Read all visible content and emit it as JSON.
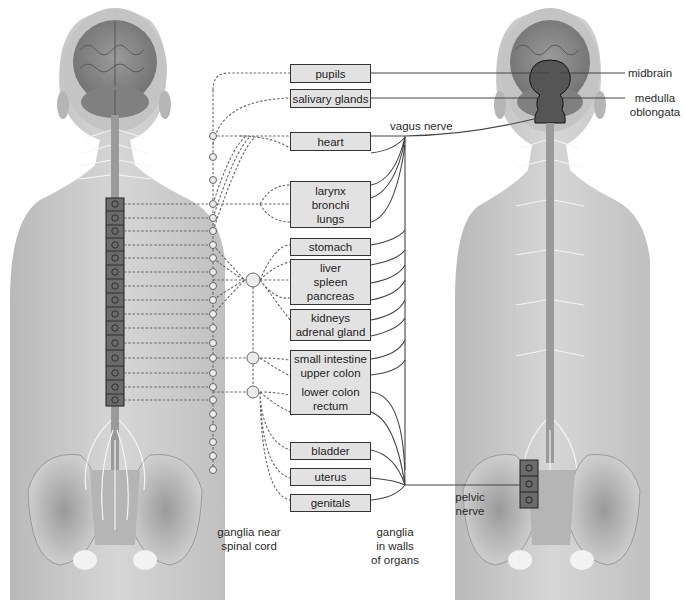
{
  "diagram": {
    "type": "autonomic-nervous-system",
    "left_figure": "sympathetic-division",
    "right_figure": "parasympathetic-division",
    "colors": {
      "skin": "#cfcfcf",
      "skin_dark": "#a8a8a8",
      "brain": "#8a8a8a",
      "nerve": "#f2f2f2",
      "box_fill": "#e2e2e2",
      "box_border": "#333333",
      "ganglion_fill": "#e6e6e6",
      "line": "#444444",
      "dashed_line": "#666666",
      "brainstem_fill": "#555555"
    }
  },
  "organs": [
    {
      "id": "pupils",
      "lines": [
        "pupils"
      ]
    },
    {
      "id": "salivary",
      "lines": [
        "salivary glands"
      ]
    },
    {
      "id": "heart",
      "lines": [
        "heart"
      ]
    },
    {
      "id": "lungs",
      "lines": [
        "larynx",
        "bronchi",
        "lungs"
      ]
    },
    {
      "id": "stomach",
      "lines": [
        "stomach"
      ]
    },
    {
      "id": "liver",
      "lines": [
        "liver",
        "spleen",
        "pancreas"
      ]
    },
    {
      "id": "kidneys",
      "lines": [
        "kidneys",
        "adrenal gland"
      ]
    },
    {
      "id": "intestine",
      "lines": [
        "small intestine",
        "upper colon",
        "lower colon",
        "rectum"
      ]
    },
    {
      "id": "bladder",
      "lines": [
        "bladder"
      ]
    },
    {
      "id": "uterus",
      "lines": [
        "uterus"
      ]
    },
    {
      "id": "genitals",
      "lines": [
        "genitals"
      ]
    }
  ],
  "labels": {
    "vagus_nerve": "vagus nerve",
    "midbrain": "midbrain",
    "medulla_line1": "medulla",
    "medulla_line2": "oblongata",
    "pelvic_line1": "pelvic",
    "pelvic_line2": "nerve",
    "ganglia_near_line1": "ganglia near",
    "ganglia_near_line2": "spinal cord",
    "ganglia_walls_line1": "ganglia",
    "ganglia_walls_line2": "in walls",
    "ganglia_walls_line3": "of organs"
  }
}
